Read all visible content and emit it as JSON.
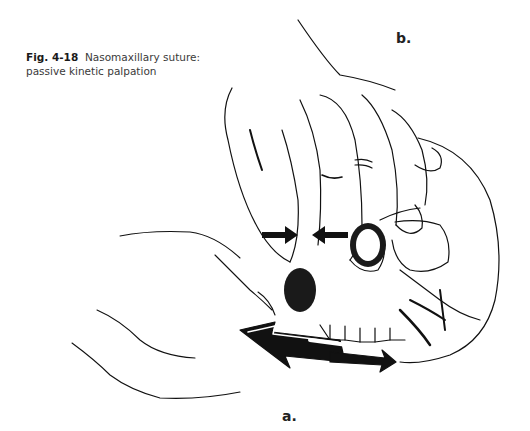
{
  "figure": {
    "number": "Fig. 4-18",
    "caption_line1": "Nasomaxillary suture:",
    "caption_line2": "passive kinetic palpation",
    "labels": {
      "a": "a.",
      "b": "b."
    },
    "illustration": {
      "description": "Line drawing of a skull held by two hands; upper hand (b) palpates the nasomaxillary suture with fingertips while lower hand (a) holds the maxilla",
      "arrows": [
        {
          "name": "compression-arrow-left",
          "direction": "right",
          "location": "left of nasal bridge"
        },
        {
          "name": "compression-arrow-right",
          "direction": "left",
          "location": "right of nasal bridge"
        },
        {
          "name": "motion-arrow-large",
          "direction": "left",
          "location": "under maxilla"
        },
        {
          "name": "motion-arrow-small",
          "direction": "right",
          "location": "under maxilla"
        }
      ],
      "colors": {
        "line": "#111111",
        "background": "#ffffff"
      }
    }
  }
}
